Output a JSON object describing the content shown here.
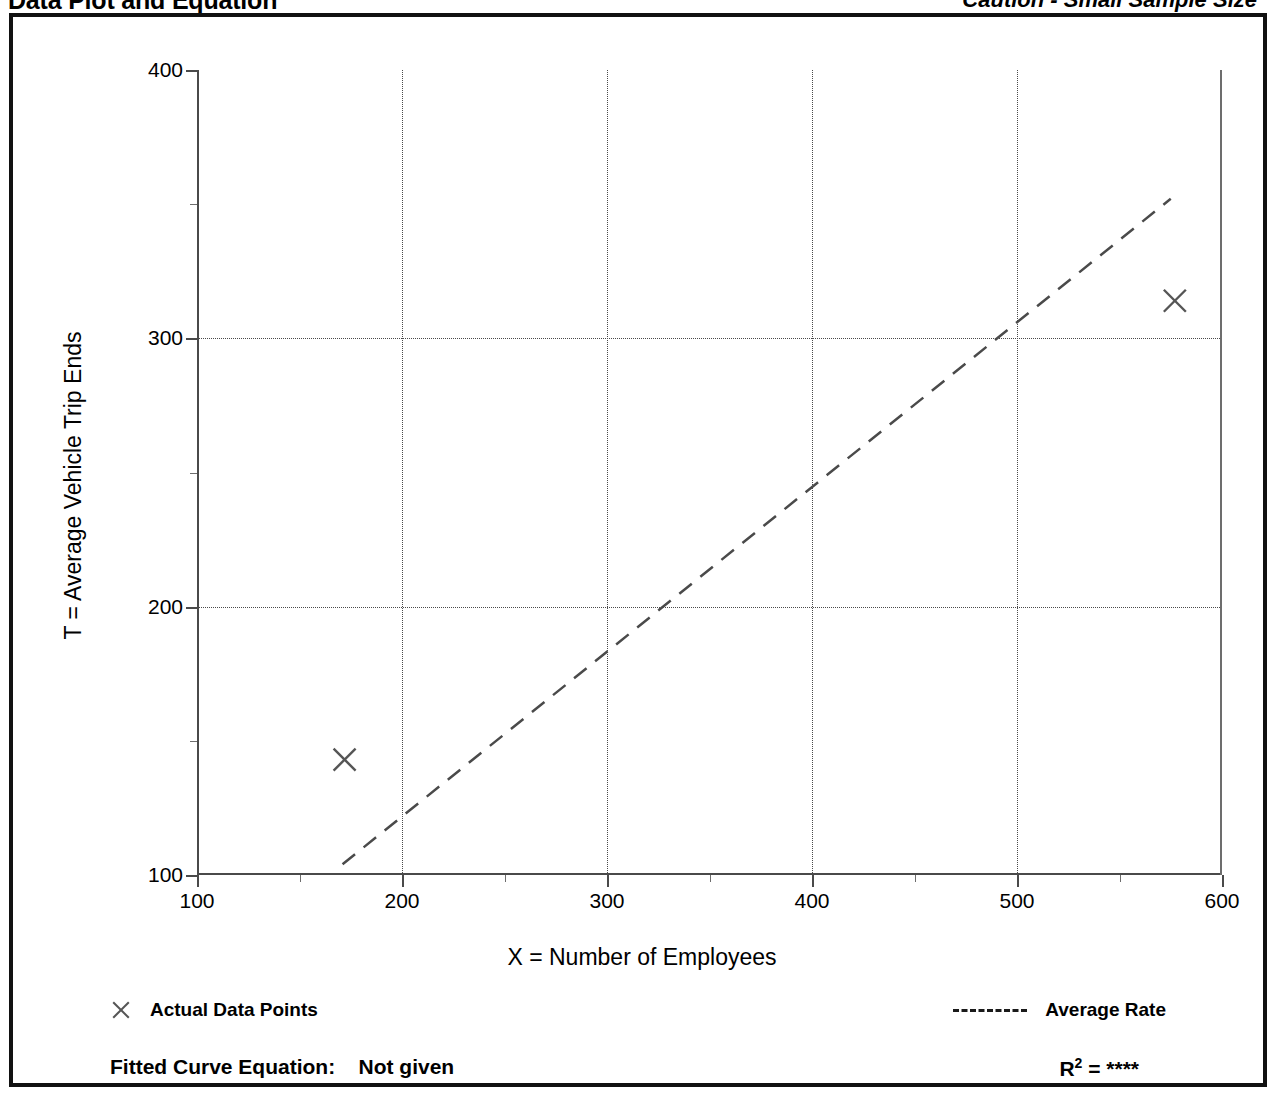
{
  "header": {
    "title": "Data Plot and Equation",
    "caution": "Caution - Small Sample Size"
  },
  "footer": {
    "fitted_label": "Fitted Curve Equation:",
    "fitted_value": "Not given",
    "r_symbol": "R",
    "r_exponent": "2",
    "r_equals": "=",
    "r_value": "****"
  },
  "legend": {
    "points_label": "Actual Data Points",
    "rate_label": "Average Rate",
    "marker_icon": "x-cross-icon",
    "line_icon": "dashed-line-icon"
  },
  "colors": {
    "frame": "#111111",
    "axis": "#4a4a4a",
    "grid": "#4a4a4a",
    "marker": "#555555",
    "trendline": "#4a4a4a",
    "background": "#ffffff"
  },
  "chart_data": {
    "type": "scatter",
    "title": "Data Plot and Equation",
    "subtitle": "Caution - Small Sample Size",
    "xlabel": "X = Number of Employees",
    "ylabel": "T = Average Vehicle Trip Ends",
    "xlim": [
      100,
      600
    ],
    "ylim": [
      100,
      400
    ],
    "xticks": [
      100,
      200,
      300,
      400,
      500,
      600
    ],
    "yticks": [
      100,
      200,
      300,
      400
    ],
    "x_minor_ticks": [
      150,
      250,
      350,
      450,
      550
    ],
    "y_minor_ticks": [
      150,
      250,
      350
    ],
    "grid": "dotted-both-axes",
    "legend_position": "below-axes",
    "series": [
      {
        "name": "Actual Data Points",
        "type": "scatter",
        "marker": "x",
        "points": [
          {
            "x": 172,
            "y": 143
          },
          {
            "x": 577,
            "y": 314
          }
        ]
      },
      {
        "name": "Average Rate",
        "type": "line",
        "style": "dashed",
        "points": [
          {
            "x": 171,
            "y": 104
          },
          {
            "x": 575,
            "y": 352
          }
        ]
      }
    ],
    "annotations": {
      "fitted_curve_equation": "Not given",
      "r_squared": "****"
    }
  }
}
